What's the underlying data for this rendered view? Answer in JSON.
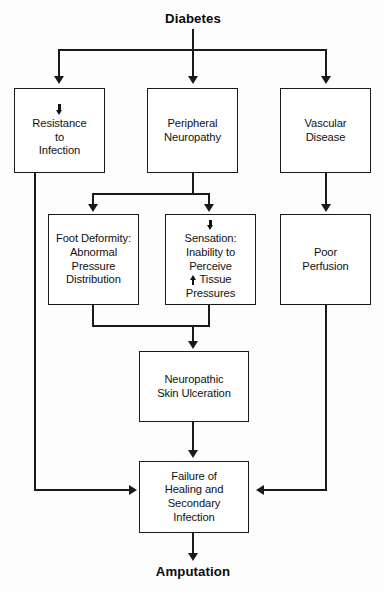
{
  "diagram": {
    "title": "Diabetes",
    "outcome": "Amputation",
    "nodes": {
      "diabetes": {
        "label": "Diabetes"
      },
      "resistance": {
        "prefix_icon": "down-arrow-icon",
        "line1": "Resistance",
        "line2": "to",
        "line3": "Infection"
      },
      "peripheral_neuropathy": {
        "line1": "Peripheral",
        "line2": "Neuropathy"
      },
      "vascular_disease": {
        "line1": "Vascular",
        "line2": "Disease"
      },
      "foot_deformity": {
        "line1": "Foot Deformity:",
        "line2": "Abnormal",
        "line3": "Pressure",
        "line4": "Distribution"
      },
      "sensation": {
        "prefix_icon": "down-arrow-icon",
        "line1": "Sensation:",
        "line2": "Inability to",
        "line3": "Perceive",
        "line4_icon": "up-arrow-icon",
        "line4": "Tissue",
        "line5": "Pressures"
      },
      "poor_perfusion": {
        "line1": "Poor",
        "line2": "Perfusion"
      },
      "neuropathic_ulcer": {
        "line1": "Neuropathic",
        "line2": "Skin Ulceration"
      },
      "failure_healing": {
        "line1": "Failure of",
        "line2": "Healing and",
        "line3": "Secondary",
        "line4": "Infection"
      },
      "amputation": {
        "label": "Amputation"
      }
    },
    "colors": {
      "stroke": "#1a1a1a",
      "text": "#111111",
      "background": "#fdfdfd",
      "box_fill": "#ffffff"
    }
  }
}
